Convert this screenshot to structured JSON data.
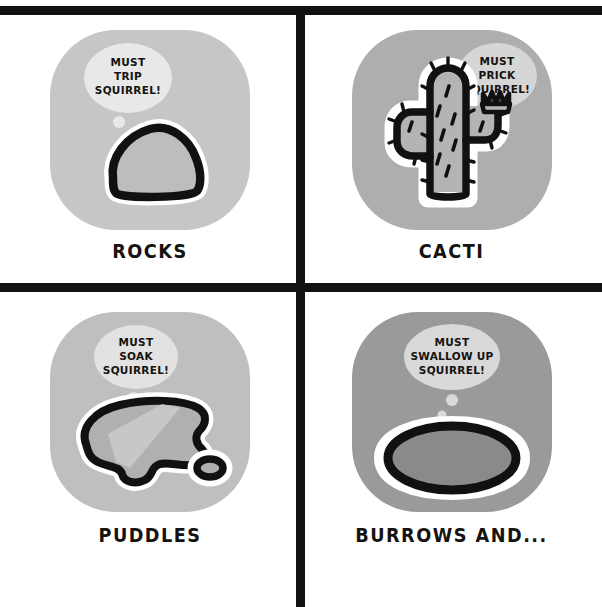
{
  "comic": {
    "title": "Desert hazards thinking about the squirrel",
    "background_color": "#ffffff",
    "ink_color": "#111111",
    "outline_highlight_color": "#ffffff",
    "panels": [
      {
        "id": "rocks",
        "position": "top-left",
        "caption": "ROCKS",
        "tile_color": "#c6c6c6",
        "subject_icon": "rock-icon",
        "subject_fill": "#bdbdbd",
        "bubble": {
          "icon": "thought-bubble-icon",
          "color": "#e8e8e8",
          "lines": [
            "MUST",
            "TRIP",
            "SQUIRREL!"
          ],
          "side": "left",
          "dot_count": 2
        }
      },
      {
        "id": "cacti",
        "position": "top-right",
        "caption": "CACTI",
        "tile_color": "#aeaeae",
        "subject_icon": "cactus-icon",
        "subject_fill": "#b4b4b4",
        "bubble": {
          "icon": "thought-bubble-icon",
          "color": "#d6d6d6",
          "lines": [
            "MUST",
            "PRICK",
            "SQUIRREL!"
          ],
          "side": "right",
          "dot_count": 2
        }
      },
      {
        "id": "puddles",
        "position": "bottom-left",
        "caption": "PUDDLES",
        "tile_color": "#bfbfbf",
        "subject_icon": "puddle-icon",
        "subject_fill": "#b0b0b0",
        "bubble": {
          "icon": "thought-bubble-icon",
          "color": "#e2e2e2",
          "lines": [
            "MUST",
            "SOAK",
            "SQUIRREL!"
          ],
          "side": "left",
          "dot_count": 2
        }
      },
      {
        "id": "burrows",
        "position": "bottom-right",
        "caption": "BURROWS AND...",
        "tile_color": "#9a9a9a",
        "subject_icon": "burrow-hole-icon",
        "subject_fill": "#8a8a8a",
        "bubble": {
          "icon": "thought-bubble-icon",
          "color": "#d9d9d9",
          "lines": [
            "MUST",
            "SWALLOW UP",
            "SQUIRREL!"
          ],
          "side": "center",
          "dot_count": 2
        }
      }
    ]
  }
}
